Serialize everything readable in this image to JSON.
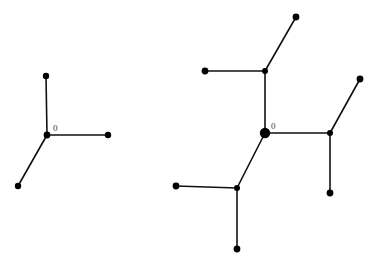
{
  "figure": {
    "title": "",
    "background_color": "#ffffff",
    "stroke_color": "#111111",
    "node_color": "#000000",
    "label_color": "#3a3a3a",
    "width": 376,
    "height": 267
  },
  "chart_data": {
    "type": "diagram",
    "title": "",
    "xlabel": "",
    "ylabel": "",
    "graphs": [
      {
        "name": "left-tree",
        "root_label": "0",
        "degree": 3,
        "depth": 1,
        "node_count": 4,
        "edge_count": 3,
        "nodes": [
          {
            "id": "L0",
            "label": "0",
            "x": 47,
            "y": 135,
            "r": 3.4,
            "kind": "root"
          },
          {
            "id": "L1",
            "label": "",
            "x": 46,
            "y": 76,
            "r": 3.2,
            "kind": "leaf"
          },
          {
            "id": "L2",
            "label": "",
            "x": 108,
            "y": 135,
            "r": 3.2,
            "kind": "leaf"
          },
          {
            "id": "L3",
            "label": "",
            "x": 18,
            "y": 186,
            "r": 3.2,
            "kind": "leaf"
          }
        ],
        "edges": [
          {
            "from": "L0",
            "to": "L1"
          },
          {
            "from": "L0",
            "to": "L2"
          },
          {
            "from": "L0",
            "to": "L3"
          }
        ]
      },
      {
        "name": "right-tree",
        "root_label": "0",
        "degree": 3,
        "depth": 2,
        "node_count": 10,
        "edge_count": 9,
        "nodes": [
          {
            "id": "R0",
            "label": "0",
            "x": 265,
            "y": 133,
            "r": 5.2,
            "kind": "root"
          },
          {
            "id": "R1",
            "label": "",
            "x": 265,
            "y": 71,
            "r": 3.0,
            "kind": "branch"
          },
          {
            "id": "R2",
            "label": "",
            "x": 330,
            "y": 133,
            "r": 3.0,
            "kind": "branch"
          },
          {
            "id": "R3",
            "label": "",
            "x": 237,
            "y": 188,
            "r": 3.0,
            "kind": "branch"
          },
          {
            "id": "R4",
            "label": "",
            "x": 205,
            "y": 71,
            "r": 3.4,
            "kind": "leaf"
          },
          {
            "id": "R5",
            "label": "",
            "x": 296,
            "y": 17,
            "r": 3.4,
            "kind": "leaf"
          },
          {
            "id": "R6",
            "label": "",
            "x": 360,
            "y": 79,
            "r": 3.4,
            "kind": "leaf"
          },
          {
            "id": "R7",
            "label": "",
            "x": 330,
            "y": 193,
            "r": 3.4,
            "kind": "leaf"
          },
          {
            "id": "R8",
            "label": "",
            "x": 176,
            "y": 186,
            "r": 3.4,
            "kind": "leaf"
          },
          {
            "id": "R9",
            "label": "",
            "x": 237,
            "y": 249,
            "r": 3.4,
            "kind": "leaf"
          }
        ],
        "edges": [
          {
            "from": "R0",
            "to": "R1"
          },
          {
            "from": "R0",
            "to": "R2"
          },
          {
            "from": "R0",
            "to": "R3"
          },
          {
            "from": "R1",
            "to": "R4"
          },
          {
            "from": "R1",
            "to": "R5"
          },
          {
            "from": "R2",
            "to": "R6"
          },
          {
            "from": "R2",
            "to": "R7"
          },
          {
            "from": "R3",
            "to": "R8"
          },
          {
            "from": "R3",
            "to": "R9"
          }
        ]
      }
    ]
  }
}
